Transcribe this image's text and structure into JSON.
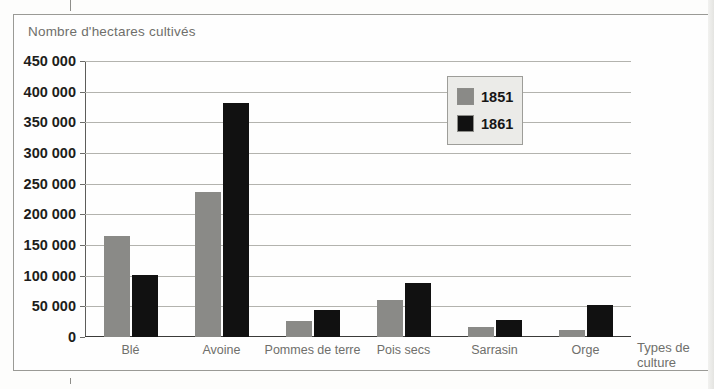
{
  "figure": {
    "title": "Nombre d'hectares cultivés"
  },
  "legend": {
    "items": [
      {
        "label": "1851",
        "color": "#8a8a87",
        "swatch": "legend-swatch-1851"
      },
      {
        "label": "1861",
        "color": "#111111",
        "swatch": "legend-swatch-1861"
      }
    ]
  },
  "axes": {
    "y_tick_labels": [
      "450 000",
      "400 000",
      "350 000",
      "300 000",
      "250 000",
      "200 000",
      "150 000",
      "100 000",
      "50 000",
      "0"
    ],
    "x_axis_title_line1": "Types de",
    "x_axis_title_line2": "culture"
  },
  "chart_data": {
    "type": "bar",
    "title": "Nombre d'hectares cultivés",
    "xlabel": "Types de culture",
    "ylabel": "Nombre d'hectares cultivés",
    "ylim": [
      0,
      450000
    ],
    "ytick_step": 50000,
    "yticks": [
      0,
      50000,
      100000,
      150000,
      200000,
      250000,
      300000,
      350000,
      400000,
      450000
    ],
    "grid": true,
    "legend_position": "inside-top-right",
    "categories": [
      "Blé",
      "Avoine",
      "Pommes de terre",
      "Pois secs",
      "Sarrasin",
      "Orge"
    ],
    "series": [
      {
        "name": "1851",
        "color": "#8a8a87",
        "values": [
          165000,
          237000,
          26000,
          60000,
          17000,
          11000
        ]
      },
      {
        "name": "1861",
        "color": "#111111",
        "values": [
          101000,
          382000,
          44000,
          88000,
          27000,
          52000
        ]
      }
    ]
  }
}
